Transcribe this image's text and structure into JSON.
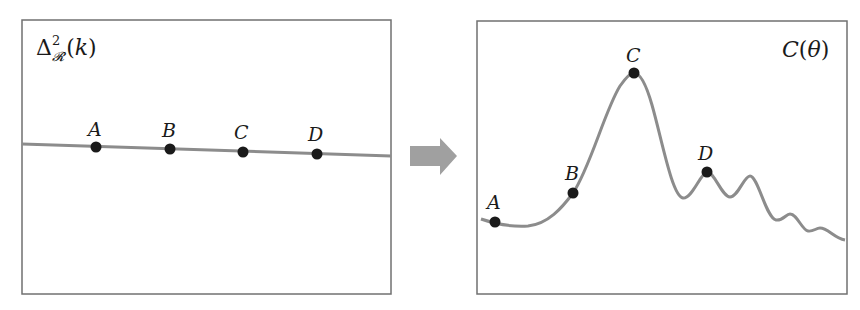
{
  "left_panel": {
    "title_symbol": "Δ",
    "title_sup": "2",
    "title_sub": "𝓡",
    "title_arg": "(k)",
    "points": [
      {
        "label": "A",
        "x": 96,
        "y": 147
      },
      {
        "label": "B",
        "x": 170,
        "y": 149
      },
      {
        "label": "C",
        "x": 243,
        "y": 152
      },
      {
        "label": "D",
        "x": 317,
        "y": 154
      }
    ]
  },
  "arrow": {
    "direction": "right",
    "color": "#a0a0a0"
  },
  "right_panel": {
    "title_fn": "C",
    "title_arg_open": "(",
    "title_arg": "θ",
    "title_arg_close": ")",
    "points": [
      {
        "label": "A",
        "x": 495,
        "y": 222
      },
      {
        "label": "B",
        "x": 573,
        "y": 193
      },
      {
        "label": "C",
        "x": 634,
        "y": 73
      },
      {
        "label": "D",
        "x": 707,
        "y": 172
      }
    ]
  },
  "colors": {
    "frame": "#707070",
    "curve": "#8c8c8c",
    "point": "#1a1a1a",
    "arrow": "#a0a0a0"
  }
}
